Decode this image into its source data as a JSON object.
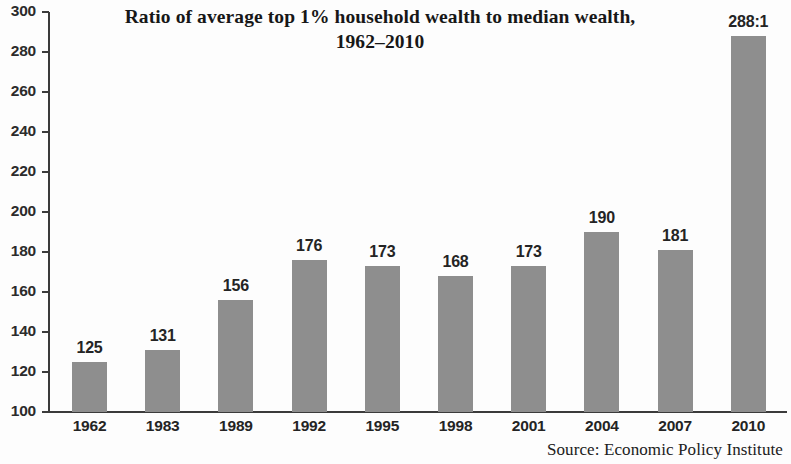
{
  "chart_data": {
    "type": "bar",
    "title": "Ratio of average top 1% household wealth to median wealth,",
    "title_line2": "1962–2010",
    "subtitle": "",
    "xlabel": "",
    "ylabel": "",
    "categories": [
      "1962",
      "1983",
      "1989",
      "1992",
      "1995",
      "1998",
      "2001",
      "2004",
      "2007",
      "2010"
    ],
    "values": [
      125,
      131,
      156,
      176,
      173,
      168,
      173,
      190,
      181,
      288
    ],
    "data_labels": [
      "125",
      "131",
      "156",
      "176",
      "173",
      "168",
      "173",
      "190",
      "181",
      "288:1"
    ],
    "ylim": [
      100,
      300
    ],
    "ytick_step": 20,
    "yticks": [
      "300",
      "280",
      "260",
      "240",
      "220",
      "200",
      "180",
      "160",
      "140",
      "120",
      "100"
    ],
    "grid": false,
    "legend": null,
    "bar_color": "#8e8e8e",
    "axis_color": "#3b3b3b",
    "annotations": [
      "Source: Economic Policy Institute"
    ]
  },
  "source": {
    "text": "Source: Economic Policy Institute"
  }
}
